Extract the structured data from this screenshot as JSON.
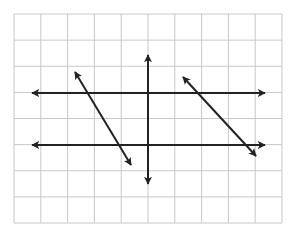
{
  "diagram": {
    "title": "",
    "background": "#ffffff",
    "grid": {
      "x0": 14,
      "y0": 14,
      "x1": 282,
      "y1": 223,
      "cols": 10,
      "rows": 8,
      "color": "#c8c8c8",
      "stroke_width": 1
    },
    "line_color": "#222222",
    "line_width": 2,
    "lines": [
      {
        "name": "horizontal-line-upper",
        "x1": 32,
        "y1": 93,
        "x2": 265,
        "y2": 93,
        "arrows": "both"
      },
      {
        "name": "horizontal-line-lower",
        "x1": 32,
        "y1": 145,
        "x2": 265,
        "y2": 145,
        "arrows": "both"
      },
      {
        "name": "vertical-transversal-line",
        "x1": 148,
        "y1": 55,
        "x2": 148,
        "y2": 184,
        "arrows": "both"
      },
      {
        "name": "left-diagonal-transversal",
        "x1": 75,
        "y1": 72,
        "x2": 131,
        "y2": 165,
        "arrows": "both"
      },
      {
        "name": "right-diagonal-transversal",
        "x1": 183,
        "y1": 77,
        "x2": 256,
        "y2": 156,
        "arrows": "both"
      }
    ]
  }
}
